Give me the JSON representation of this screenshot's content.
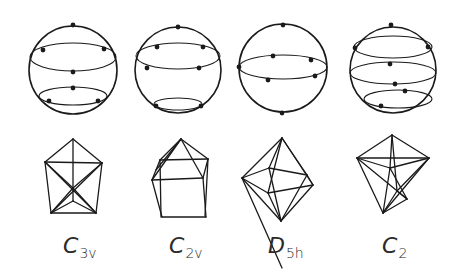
{
  "figure": {
    "background": "#ffffff",
    "ink": "#1a1a1a",
    "columns": [
      {
        "id": "c3v",
        "label_main": "C",
        "label_sub": "3v",
        "sphere": {
          "cx": 73,
          "cy": 70,
          "r": 44,
          "rings": [
            {
              "cx": 73,
              "cy": 57,
              "rx": 43,
              "ry": 14
            },
            {
              "cx": 73,
              "cy": 96,
              "rx": 34,
              "ry": 9
            }
          ],
          "points": [
            [
              73,
              25
            ],
            [
              43,
              50
            ],
            [
              104,
              49
            ],
            [
              73,
              72
            ],
            [
              73,
              88
            ],
            [
              49,
              101
            ],
            [
              98,
              101
            ]
          ]
        },
        "polyhedron": {
          "lines": [
            [
              [
                73,
                139
              ],
              [
                45,
                162
              ]
            ],
            [
              [
                73,
                139
              ],
              [
                102,
                163
              ]
            ],
            [
              [
                73,
                139
              ],
              [
                73,
                188
              ]
            ],
            [
              [
                45,
                162
              ],
              [
                102,
                163
              ]
            ],
            [
              [
                45,
                162
              ],
              [
                51,
                213
              ]
            ],
            [
              [
                102,
                163
              ],
              [
                96,
                213
              ]
            ],
            [
              [
                51,
                213
              ],
              [
                96,
                213
              ]
            ],
            [
              [
                45,
                162
              ],
              [
                96,
                213
              ]
            ],
            [
              [
                102,
                163
              ],
              [
                51,
                213
              ]
            ],
            [
              [
                45,
                162
              ],
              [
                73,
                188
              ]
            ],
            [
              [
                102,
                163
              ],
              [
                73,
                188
              ]
            ],
            [
              [
                51,
                213
              ],
              [
                73,
                188
              ]
            ],
            [
              [
                96,
                213
              ],
              [
                73,
                188
              ]
            ],
            [
              [
                51,
                213
              ],
              [
                73,
                201
              ]
            ],
            [
              [
                96,
                213
              ],
              [
                73,
                201
              ]
            ],
            [
              [
                73,
                188
              ],
              [
                73,
                201
              ]
            ]
          ]
        },
        "label_pos": [
          63,
          235
        ]
      },
      {
        "id": "c2v",
        "label_main": "C",
        "label_sub": "2v",
        "sphere": {
          "cx": 178,
          "cy": 70,
          "r": 43,
          "rings": [
            {
              "cx": 178,
              "cy": 56,
              "rx": 42,
              "ry": 13
            },
            {
              "cx": 178,
              "cy": 104,
              "rx": 24,
              "ry": 6
            }
          ],
          "points": [
            [
              178,
              27
            ],
            [
              157,
              47
            ],
            [
              203,
              47
            ],
            [
              147,
              68
            ],
            [
              199,
              68
            ],
            [
              156,
              106
            ],
            [
              201,
              106
            ]
          ]
        },
        "polyhedron": {
          "lines": [
            [
              [
                181,
                139
              ],
              [
                160,
                160
              ]
            ],
            [
              [
                181,
                139
              ],
              [
                208,
                159
              ]
            ],
            [
              [
                181,
                139
              ],
              [
                203,
                178
              ]
            ],
            [
              [
                181,
                139
              ],
              [
                152,
                180
              ]
            ],
            [
              [
                160,
                160
              ],
              [
                208,
                159
              ]
            ],
            [
              [
                160,
                160
              ],
              [
                152,
                180
              ]
            ],
            [
              [
                208,
                159
              ],
              [
                203,
                178
              ]
            ],
            [
              [
                152,
                180
              ],
              [
                203,
                178
              ]
            ],
            [
              [
                152,
                180
              ],
              [
                162,
                217
              ]
            ],
            [
              [
                203,
                178
              ],
              [
                206,
                217
              ]
            ],
            [
              [
                162,
                217
              ],
              [
                206,
                217
              ]
            ],
            [
              [
                160,
                160
              ],
              [
                161,
                217
              ]
            ],
            [
              [
                208,
                159
              ],
              [
                205,
                216
              ]
            ],
            [
              [
                181,
                139
              ],
              [
                156,
                170
              ]
            ]
          ]
        },
        "label_pos": [
          169,
          235
        ]
      },
      {
        "id": "d5h",
        "label_main": "D",
        "label_sub": "5h",
        "sphere": {
          "cx": 283,
          "cy": 68,
          "r": 44,
          "rings": [
            {
              "cx": 283,
              "cy": 67,
              "rx": 44,
              "ry": 12
            }
          ],
          "points": [
            [
              283,
              25
            ],
            [
              273,
              56
            ],
            [
              311,
              60
            ],
            [
              239,
              67
            ],
            [
              268,
              80
            ],
            [
              315,
              76
            ],
            [
              282,
              113
            ]
          ]
        },
        "polyhedron": {
          "lines": [
            [
              [
                282,
                138
              ],
              [
                242,
                178
              ]
            ],
            [
              [
                282,
                138
              ],
              [
                269,
                168
              ]
            ],
            [
              [
                282,
                138
              ],
              [
                307,
                175
              ]
            ],
            [
              [
                282,
                138
              ],
              [
                313,
                185
              ]
            ],
            [
              [
                282,
                138
              ],
              [
                268,
                193
              ]
            ],
            [
              [
                282,
                268
              ],
              [
                242,
                178
              ]
            ],
            [
              [
                242,
                178
              ],
              [
                269,
                168
              ]
            ],
            [
              [
                269,
                168
              ],
              [
                307,
                175
              ]
            ],
            [
              [
                307,
                175
              ],
              [
                313,
                185
              ]
            ],
            [
              [
                313,
                185
              ],
              [
                268,
                193
              ]
            ],
            [
              [
                268,
                193
              ],
              [
                242,
                178
              ]
            ],
            [
              [
                281,
                221
              ],
              [
                242,
                178
              ]
            ],
            [
              [
                281,
                221
              ],
              [
                269,
                168
              ]
            ],
            [
              [
                281,
                221
              ],
              [
                307,
                175
              ]
            ],
            [
              [
                281,
                221
              ],
              [
                313,
                185
              ]
            ],
            [
              [
                281,
                221
              ],
              [
                268,
                193
              ]
            ]
          ]
        },
        "label_pos": [
          268,
          235
        ]
      },
      {
        "id": "c2",
        "label_main": "C",
        "label_sub": "2",
        "sphere": {
          "cx": 393,
          "cy": 70,
          "r": 43,
          "rings": [
            {
              "cx": 393,
              "cy": 47,
              "rx": 39,
              "ry": 11
            },
            {
              "cx": 393,
              "cy": 73,
              "rx": 43,
              "ry": 11
            },
            {
              "cx": 398,
              "cy": 99,
              "rx": 34,
              "ry": 9
            }
          ],
          "points": [
            [
              391,
              25
            ],
            [
              355,
              48
            ],
            [
              428,
              47
            ],
            [
              390,
              64
            ],
            [
              395,
              84
            ],
            [
              405,
              91
            ],
            [
              381,
              106
            ]
          ]
        },
        "polyhedron": {
          "lines": [
            [
              [
                392,
                135
              ],
              [
                357,
                158
              ]
            ],
            [
              [
                392,
                135
              ],
              [
                429,
                158
              ]
            ],
            [
              [
                392,
                135
              ],
              [
                390,
                168
              ]
            ],
            [
              [
                392,
                135
              ],
              [
                397,
                191
              ]
            ],
            [
              [
                357,
                158
              ],
              [
                429,
                158
              ]
            ],
            [
              [
                357,
                158
              ],
              [
                383,
                213
              ]
            ],
            [
              [
                429,
                158
              ],
              [
                383,
                213
              ]
            ],
            [
              [
                357,
                158
              ],
              [
                407,
                199
              ]
            ],
            [
              [
                429,
                158
              ],
              [
                397,
                191
              ]
            ],
            [
              [
                390,
                168
              ],
              [
                357,
                158
              ]
            ],
            [
              [
                390,
                168
              ],
              [
                429,
                158
              ]
            ],
            [
              [
                390,
                168
              ],
              [
                383,
                213
              ]
            ],
            [
              [
                397,
                191
              ],
              [
                383,
                213
              ]
            ],
            [
              [
                407,
                199
              ],
              [
                383,
                213
              ]
            ],
            [
              [
                397,
                191
              ],
              [
                407,
                199
              ]
            ],
            [
              [
                390,
                168
              ],
              [
                407,
                199
              ]
            ]
          ]
        },
        "label_pos": [
          382,
          235
        ]
      }
    ]
  }
}
